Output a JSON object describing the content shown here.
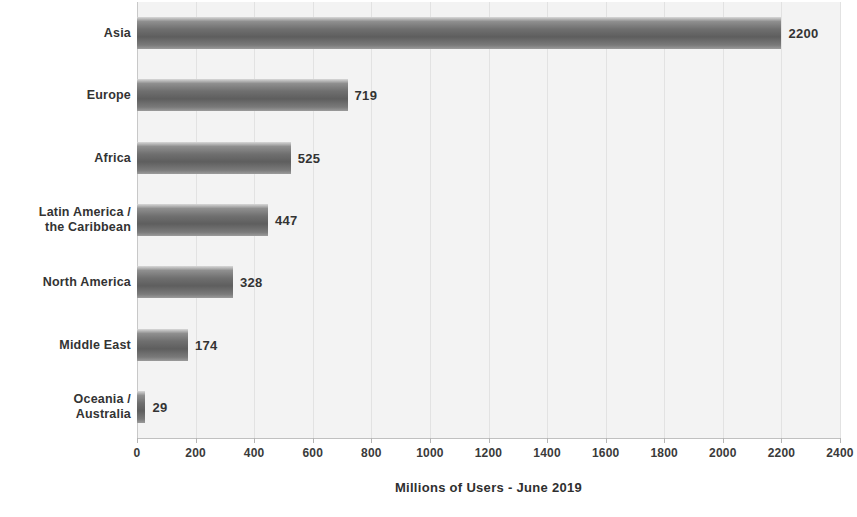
{
  "chart_data": {
    "type": "bar",
    "orientation": "horizontal",
    "title": "",
    "xlabel": "Millions of Users - June 2019",
    "ylabel": "",
    "xlim": [
      0,
      2400
    ],
    "xticks": [
      0,
      200,
      400,
      600,
      800,
      1000,
      1200,
      1400,
      1600,
      1800,
      2000,
      2200,
      2400
    ],
    "xtick_labels": [
      "0",
      "200",
      "400",
      "600",
      "800",
      "1000",
      "1200",
      "1400",
      "1600",
      "1800",
      "2000",
      "2200",
      "2400"
    ],
    "grid": true,
    "grid_axis": "x",
    "legend": false,
    "categories": [
      "Asia",
      "Europe",
      "Africa",
      "Latin America / the Caribbean",
      "North America",
      "Middle East",
      "Oceania / Australia"
    ],
    "values": [
      2200,
      719,
      525,
      447,
      328,
      174,
      29
    ],
    "value_labels": [
      "2200",
      "719",
      "525",
      "447",
      "328",
      "174",
      "29"
    ],
    "bars": [
      {
        "label_line1": "Asia",
        "label_line2": "",
        "value": 2200,
        "value_label": "2200"
      },
      {
        "label_line1": "Europe",
        "label_line2": "",
        "value": 719,
        "value_label": "719"
      },
      {
        "label_line1": "Africa",
        "label_line2": "",
        "value": 525,
        "value_label": "525"
      },
      {
        "label_line1": "Latin America /",
        "label_line2": "the Caribbean",
        "value": 447,
        "value_label": "447"
      },
      {
        "label_line1": "North America",
        "label_line2": "",
        "value": 328,
        "value_label": "328"
      },
      {
        "label_line1": "Middle East",
        "label_line2": "",
        "value": 174,
        "value_label": "174"
      },
      {
        "label_line1": "Oceania /",
        "label_line2": "Australia",
        "value": 29,
        "value_label": "29"
      }
    ],
    "colors": {
      "bar_light": "#d8d8d8",
      "bar_dark": "#5e5e5e",
      "plot_background": "#f3f3f3",
      "gridline": "#e2e2e2",
      "axis": "#c0c0c0",
      "text": "#333333"
    }
  }
}
